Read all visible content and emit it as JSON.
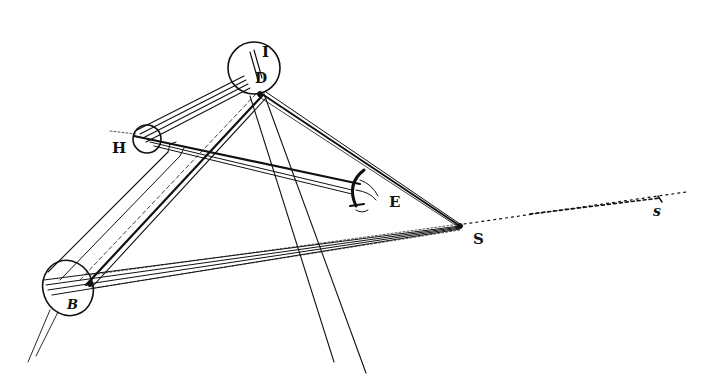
{
  "figure": {
    "ink_color": "#111111",
    "background": "#ffffff"
  },
  "labels": {
    "I": "I",
    "D": "D",
    "H": "H",
    "E": "E",
    "S": "S",
    "B": "B",
    "s": "s"
  },
  "points": {
    "D": {
      "x": 256,
      "y": 94
    },
    "H": {
      "x": 147,
      "y": 138
    },
    "E": {
      "x": 360,
      "y": 178
    },
    "S": {
      "x": 460,
      "y": 226
    },
    "B": {
      "x": 90,
      "y": 285
    },
    "s": {
      "x": 660,
      "y": 198
    }
  },
  "circles": {
    "ID": {
      "cx": 254,
      "cy": 68,
      "r": 26
    },
    "H": {
      "cx": 147,
      "cy": 139,
      "r": 14
    },
    "B": {
      "cx": 68,
      "cy": 287,
      "r": 27
    }
  }
}
